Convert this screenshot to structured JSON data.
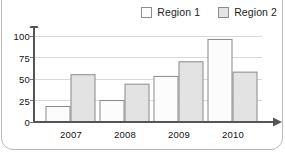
{
  "chart_data": {
    "type": "bar",
    "title": "",
    "xlabel": "",
    "ylabel": "",
    "categories": [
      "2007",
      "2008",
      "2009",
      "2010"
    ],
    "series": [
      {
        "name": "Region 1",
        "values": [
          18,
          25,
          53,
          96
        ],
        "color": "#fcfcfc"
      },
      {
        "name": "Region 2",
        "values": [
          55,
          44,
          70,
          58
        ],
        "color": "#e3e3e3"
      }
    ],
    "ylim": [
      0,
      100
    ],
    "ytick_labels": [
      "0",
      "25",
      "50",
      "75",
      "100"
    ],
    "ytick_values": [
      0,
      25,
      50,
      75,
      100
    ],
    "grid": true,
    "legend_position": "top-right"
  },
  "legend": {
    "entries": [
      {
        "label": "Region 1"
      },
      {
        "label": "Region 2"
      }
    ]
  },
  "colors": {
    "series_1_fill": "#fcfcfc",
    "series_2_fill": "#e3e3e3",
    "bar_stroke": "#8a8a8a",
    "gridline": "#d8d8d8",
    "axis": "#555555",
    "text": "#111111",
    "frame": "#b9b9b9"
  }
}
